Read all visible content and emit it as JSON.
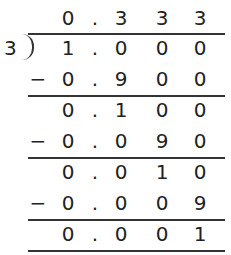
{
  "problem": {
    "divisor": "3",
    "dividend": "1.000",
    "quotient": "0.333"
  },
  "rows": [
    {
      "sign": "",
      "cells": [
        "0",
        ".",
        "3",
        "3",
        "3"
      ],
      "role": "quotient"
    },
    {
      "sign": "",
      "cells": [
        "1",
        ".",
        "0",
        "0",
        "0"
      ],
      "role": "dividend"
    },
    {
      "sign": "−",
      "cells": [
        "0",
        ".",
        "9",
        "0",
        "0"
      ],
      "role": "subtract"
    },
    {
      "sign": "",
      "cells": [
        "0",
        ".",
        "1",
        "0",
        "0"
      ],
      "role": "remainder"
    },
    {
      "sign": "−",
      "cells": [
        "0",
        ".",
        "0",
        "9",
        "0"
      ],
      "role": "subtract"
    },
    {
      "sign": "",
      "cells": [
        "0",
        ".",
        "0",
        "1",
        "0"
      ],
      "role": "remainder"
    },
    {
      "sign": "−",
      "cells": [
        "0",
        ".",
        "0",
        "0",
        "9"
      ],
      "role": "subtract"
    },
    {
      "sign": "",
      "cells": [
        "0",
        ".",
        "0",
        "0",
        "1"
      ],
      "role": "remainder"
    }
  ],
  "colors": {
    "ink": "#222222",
    "rule": "#333333",
    "background": "#ffffff"
  }
}
